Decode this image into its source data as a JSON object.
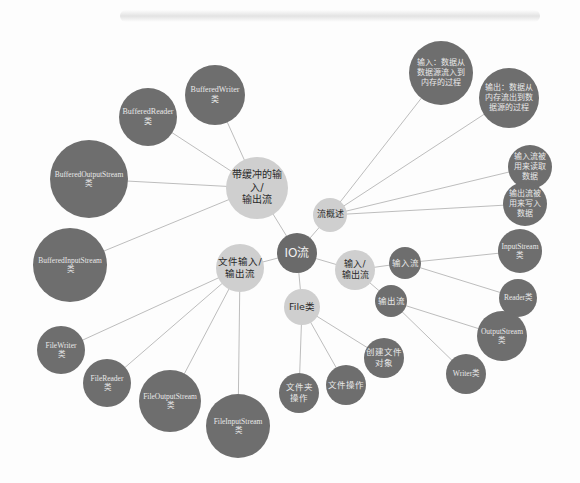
{
  "diagram": {
    "type": "mind-map",
    "root": "IO流",
    "colors": {
      "dark_node": "#6e6e6e",
      "light_node": "#cfcfcf",
      "edge": "#bdbdbd",
      "background": "#fdfdfd"
    },
    "nodes": [
      {
        "id": "io",
        "label": "IO流",
        "kind": "root",
        "x": 297,
        "y": 253,
        "r": 20,
        "fs": 12
      },
      {
        "id": "buffered",
        "label": "带缓冲的输入/\n输出流",
        "kind": "light",
        "x": 257,
        "y": 188,
        "r": 31,
        "fs": 10,
        "parent": "io"
      },
      {
        "id": "overview",
        "label": "流概述",
        "kind": "light",
        "x": 330,
        "y": 215,
        "r": 17,
        "fs": 9,
        "parent": "io"
      },
      {
        "id": "fileio",
        "label": "文件输入/\n输出流",
        "kind": "light",
        "x": 240,
        "y": 268,
        "r": 24,
        "fs": 9.5,
        "parent": "io"
      },
      {
        "id": "inout",
        "label": "输入/\n输出流",
        "kind": "light",
        "x": 355,
        "y": 270,
        "r": 20,
        "fs": 9,
        "parent": "io"
      },
      {
        "id": "file",
        "label": "File类",
        "kind": "light",
        "x": 302,
        "y": 307,
        "r": 18,
        "fs": 9.5,
        "parent": "io"
      },
      {
        "id": "bw",
        "label": "BufferedWriter\n类",
        "kind": "dark",
        "x": 215,
        "y": 95,
        "r": 30,
        "fs": 8,
        "parent": "buffered"
      },
      {
        "id": "br",
        "label": "BufferedReader\n类",
        "kind": "dark",
        "x": 148,
        "y": 117,
        "r": 29,
        "fs": 8,
        "parent": "buffered"
      },
      {
        "id": "bos",
        "label": "BufferedOutputStream\n类",
        "kind": "dark",
        "x": 89,
        "y": 179,
        "r": 39,
        "fs": 7.5,
        "parent": "buffered"
      },
      {
        "id": "bis",
        "label": "BufferedInputStream\n类",
        "kind": "dark",
        "x": 70,
        "y": 265,
        "r": 37,
        "fs": 7.5,
        "parent": "buffered"
      },
      {
        "id": "fw",
        "label": "FileWriter\n类",
        "kind": "dark",
        "x": 61,
        "y": 350,
        "r": 24,
        "fs": 7.5,
        "parent": "fileio"
      },
      {
        "id": "fr",
        "label": "FileReader\n类",
        "kind": "dark",
        "x": 107,
        "y": 383,
        "r": 24,
        "fs": 7.5,
        "parent": "fileio"
      },
      {
        "id": "fos",
        "label": "FileOutputStream\n类",
        "kind": "dark",
        "x": 170,
        "y": 401,
        "r": 31,
        "fs": 7.5,
        "parent": "fileio"
      },
      {
        "id": "fis",
        "label": "FileInputStream\n类",
        "kind": "dark",
        "x": 238,
        "y": 426,
        "r": 32,
        "fs": 7.5,
        "parent": "fileio"
      },
      {
        "id": "folder",
        "label": "文件夹\n操作",
        "kind": "dark",
        "x": 299,
        "y": 393,
        "r": 20,
        "fs": 8.5,
        "parent": "file"
      },
      {
        "id": "fileop",
        "label": "文件操作",
        "kind": "dark",
        "x": 346,
        "y": 385,
        "r": 20,
        "fs": 8.5,
        "parent": "file"
      },
      {
        "id": "create",
        "label": "创建文件\n对象",
        "kind": "dark",
        "x": 384,
        "y": 358,
        "r": 20,
        "fs": 8.5,
        "parent": "file"
      },
      {
        "id": "in_def",
        "label": "输入：数据从\n数据源流入到\n内存的过程",
        "kind": "dark",
        "x": 441,
        "y": 73,
        "r": 32,
        "fs": 8,
        "parent": "overview"
      },
      {
        "id": "out_def",
        "label": "输出：数据从\n内存流出到数\n据源的过程",
        "kind": "dark",
        "x": 509,
        "y": 98,
        "r": 30,
        "fs": 8,
        "parent": "overview"
      },
      {
        "id": "in_use",
        "label": "输入流被\n用来读取\n数据",
        "kind": "dark",
        "x": 530,
        "y": 167,
        "r": 22,
        "fs": 8,
        "parent": "overview"
      },
      {
        "id": "out_use",
        "label": "输出流被\n用来写入\n数据",
        "kind": "dark",
        "x": 525,
        "y": 204,
        "r": 22,
        "fs": 8,
        "parent": "overview"
      },
      {
        "id": "instream",
        "label": "输入流",
        "kind": "dark",
        "x": 405,
        "y": 263,
        "r": 16,
        "fs": 8.5,
        "parent": "inout"
      },
      {
        "id": "outstream",
        "label": "输出流",
        "kind": "dark",
        "x": 391,
        "y": 301,
        "r": 16,
        "fs": 8.5,
        "parent": "inout"
      },
      {
        "id": "is",
        "label": "InputStream\n类",
        "kind": "dark",
        "x": 520,
        "y": 251,
        "r": 22,
        "fs": 7.5,
        "parent": "instream"
      },
      {
        "id": "reader",
        "label": "Reader类",
        "kind": "dark",
        "x": 518,
        "y": 298,
        "r": 19,
        "fs": 7.5,
        "parent": "instream"
      },
      {
        "id": "os",
        "label": "OutputStream\n类",
        "kind": "dark",
        "x": 502,
        "y": 336,
        "r": 25,
        "fs": 7.5,
        "parent": "outstream"
      },
      {
        "id": "writer",
        "label": "Writer类",
        "kind": "dark",
        "x": 466,
        "y": 374,
        "r": 20,
        "fs": 7.5,
        "parent": "outstream"
      }
    ]
  }
}
